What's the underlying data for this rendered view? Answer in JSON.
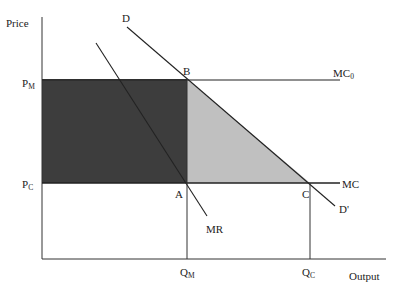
{
  "diagram": {
    "type": "monopoly-deadweight-loss",
    "y_axis_label": "Price",
    "x_axis_label": "Output",
    "price_labels": {
      "pm": {
        "main": "P",
        "sub": "M"
      },
      "pc": {
        "main": "P",
        "sub": "C"
      }
    },
    "quantity_labels": {
      "qm": {
        "main": "Q",
        "sub": "M"
      },
      "qc": {
        "main": "Q",
        "sub": "C"
      }
    },
    "curves": {
      "demand": "D",
      "demand_prime": "D'",
      "marginal_revenue": "MR",
      "marginal_cost": "MC",
      "mc0": {
        "main": "MC",
        "sub": "0"
      }
    },
    "points": {
      "a": "A",
      "b": "B",
      "c": "C"
    },
    "regions": {
      "monopoly_profit_color": "#3d3d3d",
      "deadweight_loss_color": "#c0c0c0"
    }
  }
}
